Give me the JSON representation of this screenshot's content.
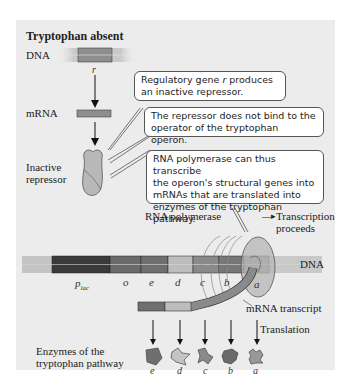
{
  "title": "Tryptophan absent",
  "labels": {
    "dna_top": "DNA",
    "r_gene": "r",
    "mrna": "mRNA",
    "inactive_repressor_line1": "Inactive",
    "inactive_repressor_line2": "repressor",
    "rna_polymerase": "RNA polymerase",
    "transcription_proceeds_line1": "Transcription",
    "transcription_proceeds_line2": "proceeds",
    "dna_main": "DNA",
    "mrna_transcript": "mRNA transcript",
    "translation": "Translation",
    "enzymes_line1": "Enzymes of the",
    "enzymes_line2": "tryptophan pathway"
  },
  "callouts": {
    "c1_line1_pre": "Regulatory gene ",
    "c1_line1_ital": "r",
    "c1_line1_post": " produces",
    "c1_line2": "an inactive repressor.",
    "c2_line1": "The repressor does not bind to the",
    "c2_line2": "operator of the tryptophan operon.",
    "c3_line1": "RNA polymerase can thus transcribe",
    "c3_line2": "the operon's structural genes into",
    "c3_line3": "mRNAs that are translated into",
    "c3_line4": "enzymes of the tryptophan pathway."
  },
  "gene_labels": {
    "p_main": "p",
    "p_sub": "lac",
    "o": "o",
    "e": "e",
    "d": "d",
    "c": "c",
    "b": "b",
    "a": "a"
  },
  "enzyme_labels": [
    "e",
    "d",
    "c",
    "b",
    "a"
  ],
  "colors": {
    "panel_bg": "#ececec",
    "dna_light": "#c9c9c9",
    "promoter": "#3a3a3a",
    "operator": "#6a6a6a",
    "gene_e": "#6f6f6f",
    "gene_d": "#bdbdbd",
    "gene_c": "#8a8a8a",
    "gene_b": "#777777",
    "gene_a": "#999999",
    "polymerase": "#b5b5b5"
  }
}
